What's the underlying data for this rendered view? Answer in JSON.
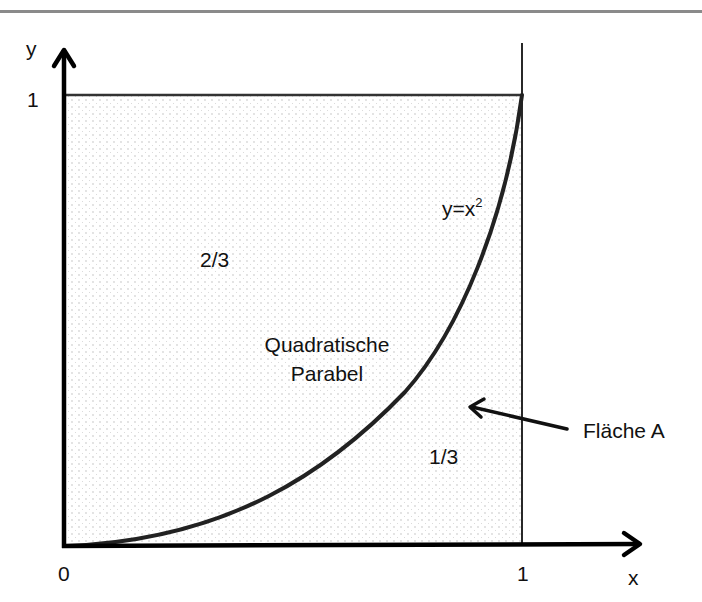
{
  "diagram": {
    "type": "area-under-curve",
    "axes": {
      "x_label": "x",
      "y_label": "y",
      "x_ticks": [
        "0",
        "1"
      ],
      "y_ticks": [
        "1"
      ]
    },
    "curve": {
      "equation_base": "y=x",
      "equation_exponent": "2",
      "name_line1": "Quadratische",
      "name_line2": "Parabel"
    },
    "regions": {
      "upper_fraction": "2/3",
      "lower_fraction": "1/3"
    },
    "annotation": {
      "label": "Fläche A"
    },
    "colors": {
      "line": "#111111",
      "fill_dots": "#b5b5b5",
      "top_rule": "#8a8a8a"
    }
  }
}
